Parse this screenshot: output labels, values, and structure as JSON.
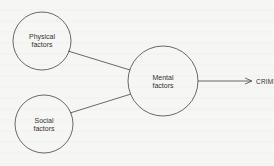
{
  "diagram": {
    "nodes": [
      {
        "id": "physical",
        "label_line1": "Physical",
        "label_line2": "factors",
        "cx": 42,
        "cy": 41,
        "r": 29
      },
      {
        "id": "social",
        "label_line1": "Social",
        "label_line2": "factors",
        "cx": 44,
        "cy": 124,
        "r": 29
      },
      {
        "id": "mental",
        "label_line1": "Mental",
        "label_line2": "factors",
        "cx": 163,
        "cy": 81,
        "r": 35
      }
    ],
    "edges": [
      {
        "from": "physical",
        "to": "mental"
      },
      {
        "from": "social",
        "to": "mental"
      },
      {
        "from": "mental",
        "to": "crime",
        "arrow": true
      }
    ],
    "outcome": "CRIME",
    "colors": {
      "stroke": "#444444",
      "background": "#f6f6f4"
    }
  }
}
